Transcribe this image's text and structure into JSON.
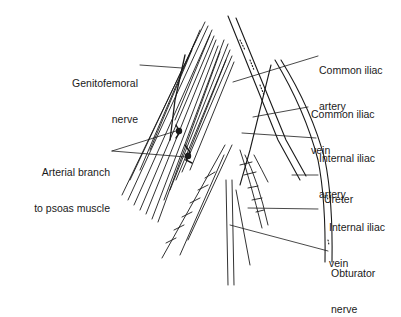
{
  "figure": {
    "line_color": "#1a1a1a",
    "background": "#ffffff"
  },
  "labels": {
    "genitofemoral": {
      "line1": "Genitofemoral",
      "line2": "nerve"
    },
    "arterial_branch": {
      "line1": "Arterial branch",
      "line2": "to psoas muscle"
    },
    "common_iliac_artery": {
      "line1": "Common iliac",
      "line2": "artery"
    },
    "common_iliac_vein": {
      "line1": "Common iliac",
      "line2": "vein"
    },
    "internal_iliac_artery": {
      "line1": "Internal iliac",
      "line2": "artery"
    },
    "ureter": {
      "line1": "Ureter"
    },
    "internal_iliac_vein": {
      "line1": "Internal iliac",
      "line2": "vein"
    },
    "obturator_nerve": {
      "line1": "Obturator",
      "line2": "nerve"
    }
  }
}
